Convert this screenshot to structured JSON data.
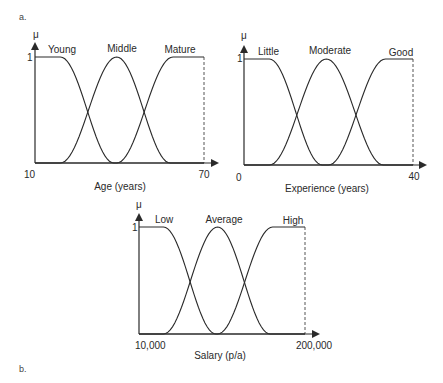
{
  "panel_labels": {
    "a": "a.",
    "b": "b."
  },
  "mu_symbol": "μ",
  "one_label": "1",
  "chart_data": [
    {
      "type": "line",
      "title": "Age membership functions",
      "xlabel": "Age (years)",
      "ylabel": "μ",
      "xlim": [
        10,
        70
      ],
      "ylim": [
        0,
        1
      ],
      "x_tick_labels": [
        "10",
        "70"
      ],
      "y_tick_labels": [
        "1"
      ],
      "grid": false,
      "legend": "inline labels above curves",
      "series": [
        {
          "name": "Young",
          "points": [
            [
              10,
              1
            ],
            [
              19,
              1
            ],
            [
              38,
              0
            ],
            [
              70,
              0
            ]
          ]
        },
        {
          "name": "Middle",
          "points": [
            [
              10,
              0
            ],
            [
              19,
              0
            ],
            [
              39,
              1
            ],
            [
              58,
              0
            ],
            [
              70,
              0
            ]
          ]
        },
        {
          "name": "Mature",
          "points": [
            [
              10,
              0
            ],
            [
              39,
              0
            ],
            [
              59,
              1
            ],
            [
              70,
              1
            ]
          ]
        }
      ]
    },
    {
      "type": "line",
      "title": "Experience membership functions",
      "xlabel": "Experience (years)",
      "ylabel": "μ",
      "xlim": [
        0,
        40
      ],
      "ylim": [
        0,
        1
      ],
      "x_tick_labels": [
        "0",
        "40"
      ],
      "y_tick_labels": [
        "1"
      ],
      "grid": false,
      "legend": "inline labels above curves",
      "series": [
        {
          "name": "Little",
          "points": [
            [
              0,
              1
            ],
            [
              6,
              1
            ],
            [
              18.5,
              0
            ],
            [
              40,
              0
            ]
          ]
        },
        {
          "name": "Moderate",
          "points": [
            [
              0,
              0
            ],
            [
              6,
              0
            ],
            [
              19.5,
              1
            ],
            [
              33,
              0
            ],
            [
              40,
              0
            ]
          ]
        },
        {
          "name": "Good",
          "points": [
            [
              0,
              0
            ],
            [
              20,
              0
            ],
            [
              33.5,
              1
            ],
            [
              40,
              1
            ]
          ]
        }
      ]
    },
    {
      "type": "line",
      "title": "Salary membership functions",
      "xlabel": "Salary (p/a)",
      "ylabel": "μ",
      "xlim": [
        10000,
        200000
      ],
      "ylim": [
        0,
        1
      ],
      "x_tick_labels": [
        "10,000",
        "200,000"
      ],
      "y_tick_labels": [
        "1"
      ],
      "grid": false,
      "legend": "inline labels above curves",
      "series": [
        {
          "name": "Low",
          "points": [
            [
              10000,
              1
            ],
            [
              38000,
              1
            ],
            [
              98000,
              0
            ],
            [
              200000,
              0
            ]
          ]
        },
        {
          "name": "Average",
          "points": [
            [
              10000,
              0
            ],
            [
              38000,
              0
            ],
            [
              100000,
              1
            ],
            [
              160000,
              0
            ],
            [
              200000,
              0
            ]
          ]
        },
        {
          "name": "High",
          "points": [
            [
              10000,
              0
            ],
            [
              100000,
              0
            ],
            [
              163000,
              1
            ],
            [
              200000,
              1
            ]
          ]
        }
      ]
    }
  ],
  "layout": [
    {
      "x0": 35,
      "x1": 204,
      "yb": 163,
      "yt": 57,
      "arrow_end": 219,
      "ytop_axis": 42,
      "label_pos": [
        [
          48,
          53
        ],
        [
          122,
          52
        ],
        [
          180,
          53
        ]
      ],
      "xlabel_pos": [
        120,
        190
      ],
      "tick0_pos": [
        24,
        178
      ],
      "tick1_pos": [
        204,
        178
      ],
      "one_pos": [
        27,
        61
      ],
      "mu_pos": [
        36,
        38
      ]
    },
    {
      "x0": 244,
      "x1": 413,
      "yb": 165,
      "yt": 59,
      "arrow_end": 427,
      "ytop_axis": 45,
      "label_pos": [
        [
          258,
          55
        ],
        [
          330,
          54
        ],
        [
          401,
          56
        ]
      ],
      "xlabel_pos": [
        327,
        192
      ],
      "tick0_pos": [
        236,
        181
      ],
      "tick1_pos": [
        414,
        180
      ],
      "one_pos": [
        237,
        62
      ],
      "mu_pos": [
        244,
        39
      ]
    },
    {
      "x0": 139,
      "x1": 305,
      "yb": 334,
      "yt": 227,
      "arrow_end": 320,
      "ytop_axis": 213,
      "label_pos": [
        [
          155,
          223
        ],
        [
          224,
          223
        ],
        [
          293,
          224
        ]
      ],
      "xlabel_pos": [
        220,
        359
      ],
      "tick0_pos": [
        135,
        349
      ],
      "tick1_pos": [
        314,
        349
      ],
      "one_pos": [
        132,
        231
      ],
      "mu_pos": [
        139,
        208
      ]
    }
  ],
  "colors": {
    "line": "#2a2a2a",
    "axis": "#2a2a2a",
    "dashed": "#555555"
  }
}
